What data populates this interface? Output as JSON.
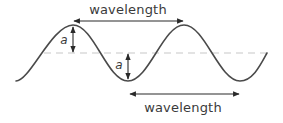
{
  "diagram": {
    "labels": {
      "wavelength_top": "wavelength",
      "wavelength_bottom": "wavelength",
      "amplitude_peak": "a",
      "amplitude_trough": "a"
    },
    "colors": {
      "wave": "#4a4a4a",
      "arrows": "#2a2a2a",
      "midline": "#c8c8c8",
      "text": "#3a3a3a",
      "background": "#ffffff"
    },
    "geometry": {
      "midline_y": 53,
      "amplitude_px": 28,
      "wavelength_px": 112,
      "wave_start_x": 16,
      "wave_end_x": 267
    }
  }
}
